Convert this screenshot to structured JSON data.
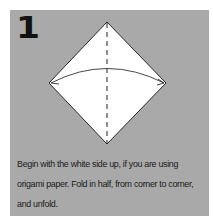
{
  "instruction": {
    "step_number": "1",
    "caption_lines": [
      "Begin with the white side up, if you are using",
      "origami paper. Fold in half, from corner to corner,",
      "and unfold."
    ],
    "diagram": {
      "shape": "square-paper-diamond",
      "fold_line": "vertical-dashed-valley-fold",
      "arrow": "curved-fold-arrow-left-to-right"
    },
    "colors": {
      "panel_background": "#a9a9a9",
      "paper": "#ffffff",
      "lines": "#333333",
      "text": "#1a1a1a"
    }
  }
}
